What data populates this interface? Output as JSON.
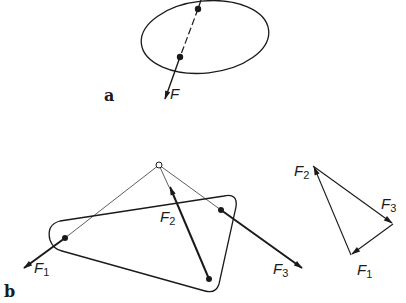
{
  "figure": {
    "panels": [
      {
        "id": "a",
        "label": "a",
        "description": "Rigid body (ellipse) with force F acting along a dashed line of action through two points",
        "force": {
          "name": "F",
          "symbol": "F"
        }
      },
      {
        "id": "b",
        "label": "b",
        "description": "Rigid plate with three forces F1, F2, F3 whose lines of action meet at a common point, plus closed force triangle",
        "forces": [
          {
            "name": "F1",
            "symbol": "F",
            "subscript": "1"
          },
          {
            "name": "F2",
            "symbol": "F",
            "subscript": "2"
          },
          {
            "name": "F3",
            "symbol": "F",
            "subscript": "3"
          }
        ],
        "force_triangle": {
          "labels": [
            {
              "symbol": "F",
              "subscript": "2"
            },
            {
              "symbol": "F",
              "subscript": "3"
            },
            {
              "symbol": "F",
              "subscript": "1"
            }
          ]
        }
      }
    ],
    "colors": {
      "stroke": "#1a1a1a",
      "background": "#ffffff"
    }
  }
}
